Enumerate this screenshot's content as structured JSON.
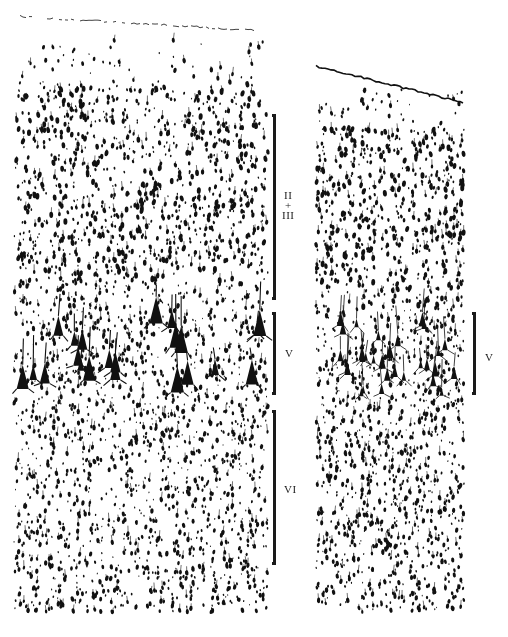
{
  "figure": {
    "background": "#ffffff",
    "ink": "#111111",
    "panels": [
      {
        "id": "left-section",
        "x": 14,
        "y": 12,
        "width": 254,
        "height": 600,
        "topEdgeY": 16,
        "layer5": {
          "y0": 300,
          "y1": 390
        },
        "density": 1.0
      },
      {
        "id": "right-section",
        "x": 316,
        "y": 62,
        "width": 148,
        "height": 550,
        "topEdgeY": 66,
        "layer5": {
          "y0": 305,
          "y1": 395
        },
        "density": 1.15
      }
    ],
    "brackets": [
      {
        "name": "bracket-layer-2-3",
        "x": 273,
        "y0": 114,
        "y1": 300,
        "labelLines": [
          "II",
          "+",
          "III"
        ],
        "labelX": 282,
        "labelY": 190
      },
      {
        "name": "bracket-layer-5-left",
        "x": 273,
        "y0": 312,
        "y1": 395,
        "labelLines": [
          "V"
        ],
        "labelX": 285,
        "labelY": 348
      },
      {
        "name": "bracket-layer-6",
        "x": 273,
        "y0": 410,
        "y1": 565,
        "labelLines": [
          "VI"
        ],
        "labelX": 284,
        "labelY": 484
      },
      {
        "name": "bracket-layer-5-right",
        "x": 473,
        "y0": 312,
        "y1": 395,
        "labelLines": [
          "V"
        ],
        "labelX": 485,
        "labelY": 352
      }
    ]
  }
}
